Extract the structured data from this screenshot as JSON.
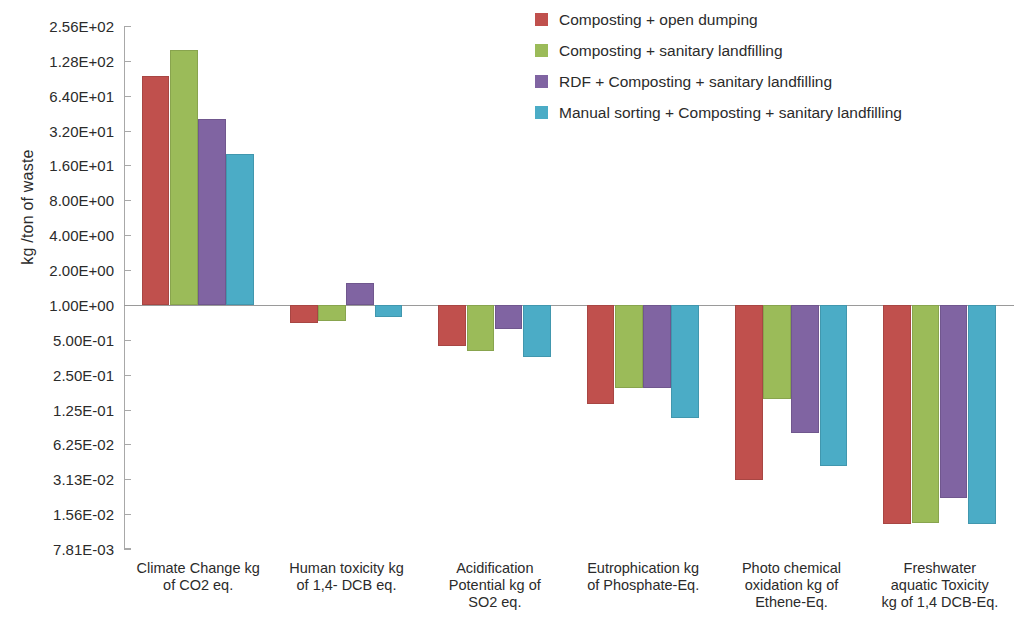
{
  "chart_data": {
    "type": "bar",
    "title": "",
    "subtitle": "",
    "xlabel": "",
    "ylabel": "kg /ton of waste",
    "yscale": "log",
    "ylim": [
      0.00781,
      256
    ],
    "grid": false,
    "legend_position": "top-right",
    "baseline": 1.0,
    "ytick_labels": [
      "2.56E+02",
      "1.28E+02",
      "6.40E+01",
      "3.20E+01",
      "1.60E+01",
      "8.00E+00",
      "4.00E+00",
      "2.00E+00",
      "1.00E+00",
      "5.00E-01",
      "2.50E-01",
      "1.25E-01",
      "6.25E-02",
      "3.13E-02",
      "1.56E-02",
      "7.81E-03"
    ],
    "ytick_values": [
      256,
      128,
      64,
      32,
      16,
      8,
      4,
      2,
      1,
      0.5,
      0.25,
      0.125,
      0.0625,
      0.0313,
      0.0156,
      0.00781
    ],
    "categories": [
      "Climate Change kg of CO2 eq.",
      "Human toxicity kg of 1,4- DCB eq.",
      "Acidification Potential kg of SO2 eq.",
      "Eutrophication kg of Phosphate-Eq.",
      "Photo chemical oxidation kg of Ethene-Eq.",
      "Freshwater aquatic Toxicity kg of 1,4 DCB-Eq."
    ],
    "category_lines": [
      [
        "Climate Change kg",
        "of CO2 eq."
      ],
      [
        "Human toxicity kg",
        "of 1,4- DCB eq."
      ],
      [
        "Acidification",
        "Potential kg of",
        "SO2 eq."
      ],
      [
        "Eutrophication kg",
        "of Phosphate-Eq."
      ],
      [
        "Photo chemical",
        "oxidation kg of",
        "Ethene-Eq."
      ],
      [
        "Freshwater",
        "aquatic Toxicity",
        "kg of 1,4 DCB-Eq."
      ]
    ],
    "series": [
      {
        "name": "Composting + open dumping",
        "color": "#C0504D",
        "values": [
          94.0,
          0.7,
          0.44,
          0.14,
          0.0305,
          0.0128
        ]
      },
      {
        "name": "Composting + sanitary landfilling",
        "color": "#9BBB59",
        "values": [
          160.0,
          0.72,
          0.4,
          0.19,
          0.155,
          0.0132
        ]
      },
      {
        "name": "RDF + Composting + sanitary landfilling",
        "color": "#8064A2",
        "values": [
          40.0,
          1.55,
          0.62,
          0.19,
          0.078,
          0.0215
        ]
      },
      {
        "name": "Manual sorting + Composting + sanitary landfilling",
        "color": "#4BACC6",
        "values": [
          20.0,
          0.78,
          0.355,
          0.105,
          0.041,
          0.0128
        ]
      }
    ]
  },
  "legend": {
    "items": [
      {
        "label": "Composting + open dumping",
        "color": "#C0504D"
      },
      {
        "label": "Composting + sanitary landfilling",
        "color": "#9BBB59"
      },
      {
        "label": "RDF + Composting + sanitary landfilling",
        "color": "#8064A2"
      },
      {
        "label": "Manual sorting + Composting + sanitary landfilling",
        "color": "#4BACC6"
      }
    ]
  },
  "axis": {
    "y_title": "kg /ton of waste"
  }
}
